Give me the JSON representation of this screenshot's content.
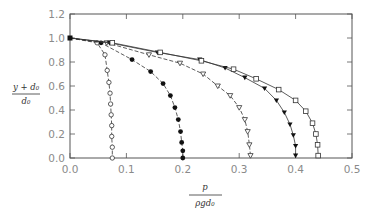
{
  "chart_data": {
    "type": "scatter",
    "title": "",
    "xlabel": {
      "numerator": "p",
      "denominator": "ρgd₀"
    },
    "ylabel": {
      "numerator": "y + d₀",
      "denominator": "d₀"
    },
    "xlim": [
      0.0,
      0.5
    ],
    "ylim": [
      0.0,
      1.2
    ],
    "x_ticks": [
      "0.0",
      "0.1",
      "0.2",
      "0.3",
      "0.4",
      "0.5"
    ],
    "y_ticks": [
      "0.0",
      "0.2",
      "0.4",
      "0.6",
      "0.8",
      "1.0",
      "1.2"
    ],
    "grid": false,
    "legend": "none",
    "start_point": {
      "x": 0.0,
      "y": 1.0
    },
    "series": [
      {
        "name": "open-circles",
        "marker": "open-circle",
        "line": "dashed",
        "points": [
          [
            0.0,
            1.0
          ],
          [
            0.048,
            0.96
          ],
          [
            0.062,
            0.86
          ],
          [
            0.066,
            0.73
          ],
          [
            0.069,
            0.63
          ],
          [
            0.071,
            0.54
          ],
          [
            0.072,
            0.45
          ],
          [
            0.073,
            0.36
          ],
          [
            0.074,
            0.27
          ],
          [
            0.074,
            0.18
          ],
          [
            0.075,
            0.09
          ],
          [
            0.075,
            0.0
          ]
        ]
      },
      {
        "name": "filled-circles",
        "marker": "filled-circle",
        "line": "dashed",
        "points": [
          [
            0.0,
            1.0
          ],
          [
            0.055,
            0.96
          ],
          [
            0.11,
            0.82
          ],
          [
            0.143,
            0.72
          ],
          [
            0.165,
            0.62
          ],
          [
            0.178,
            0.52
          ],
          [
            0.186,
            0.42
          ],
          [
            0.192,
            0.32
          ],
          [
            0.196,
            0.22
          ],
          [
            0.198,
            0.13
          ],
          [
            0.2,
            0.06
          ],
          [
            0.2,
            0.0
          ]
        ]
      },
      {
        "name": "open-triangles",
        "marker": "open-triangle-down",
        "line": "dashed",
        "points": [
          [
            0.0,
            1.0
          ],
          [
            0.065,
            0.96
          ],
          [
            0.14,
            0.86
          ],
          [
            0.195,
            0.79
          ],
          [
            0.236,
            0.7
          ],
          [
            0.262,
            0.6
          ],
          [
            0.284,
            0.52
          ],
          [
            0.3,
            0.42
          ],
          [
            0.31,
            0.32
          ],
          [
            0.315,
            0.22
          ],
          [
            0.318,
            0.11
          ],
          [
            0.32,
            0.02
          ]
        ]
      },
      {
        "name": "filled-triangles",
        "marker": "filled-triangle-down",
        "line": "solid",
        "points": [
          [
            0.0,
            1.0
          ],
          [
            0.07,
            0.96
          ],
          [
            0.155,
            0.88
          ],
          [
            0.23,
            0.82
          ],
          [
            0.275,
            0.75
          ],
          [
            0.31,
            0.67
          ],
          [
            0.345,
            0.58
          ],
          [
            0.366,
            0.48
          ],
          [
            0.38,
            0.38
          ],
          [
            0.39,
            0.28
          ],
          [
            0.396,
            0.19
          ],
          [
            0.4,
            0.1
          ],
          [
            0.4,
            0.02
          ]
        ]
      },
      {
        "name": "open-squares",
        "marker": "open-square",
        "line": "solid",
        "points": [
          [
            0.0,
            1.0
          ],
          [
            0.075,
            0.96
          ],
          [
            0.16,
            0.88
          ],
          [
            0.233,
            0.81
          ],
          [
            0.29,
            0.74
          ],
          [
            0.33,
            0.66
          ],
          [
            0.37,
            0.57
          ],
          [
            0.4,
            0.48
          ],
          [
            0.418,
            0.39
          ],
          [
            0.43,
            0.29
          ],
          [
            0.436,
            0.2
          ],
          [
            0.439,
            0.11
          ],
          [
            0.44,
            0.02
          ]
        ]
      }
    ]
  }
}
